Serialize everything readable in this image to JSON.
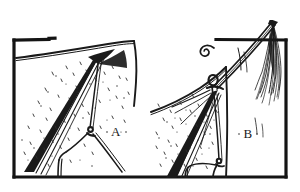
{
  "figure": {
    "style": "pen-and-ink line drawing",
    "background_color": "#ffffff",
    "ink_color": "#1a1a1a",
    "frame": {
      "border_color": "#141414",
      "border_weight_px": 3.2,
      "x": 14,
      "y": 38,
      "width": 272,
      "height": 140
    },
    "panels": [
      {
        "id": "A",
        "label": "A",
        "label_x": 116,
        "label_y": 136,
        "description": "Tent corner with seam rope running to a guy-line loop and stake"
      },
      {
        "id": "B",
        "label": "B",
        "label_x": 248,
        "label_y": 138,
        "description": "Tent corner with knotted loop, tassel and spiral cord detail"
      }
    ],
    "details": [
      {
        "name": "spiral-cord",
        "x": 207,
        "y": 42
      },
      {
        "name": "tassel-fringe",
        "x": 272,
        "y": 52
      },
      {
        "name": "knot-loop-a",
        "x": 91,
        "y": 131
      },
      {
        "name": "knot-loop-b",
        "x": 214,
        "y": 87
      },
      {
        "name": "stake-peg-b",
        "x": 219,
        "y": 163
      }
    ]
  }
}
